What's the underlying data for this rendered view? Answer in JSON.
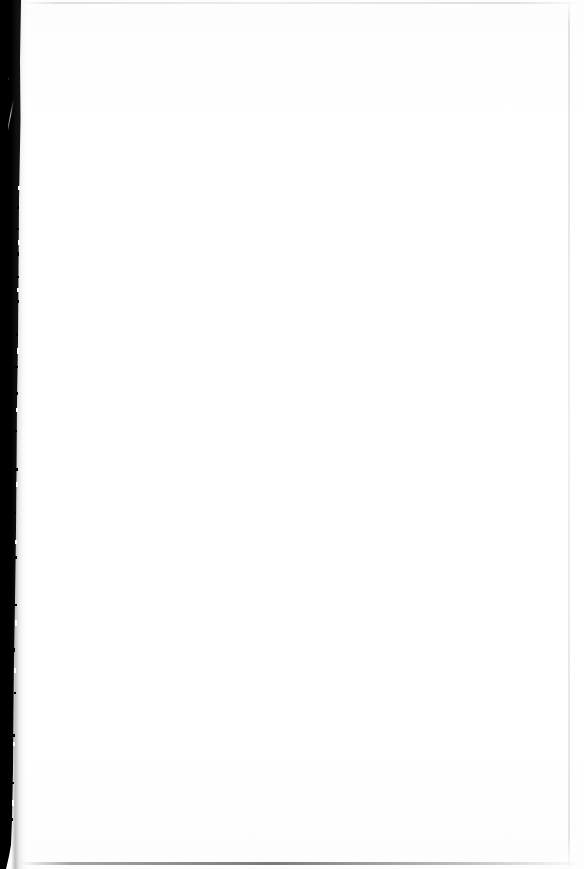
{
  "document": {
    "kind": "scanned-page",
    "page_state": "blank",
    "visible_text": "",
    "width_px": 584,
    "height_px": 869
  },
  "colors": {
    "paper": "#ffffff",
    "gutter": "#000000",
    "edge_hairline": "#9a9ca2",
    "bottom_hairline": "#404248"
  },
  "regions": {
    "paper": {
      "name": "blank-paper-surface",
      "description": ""
    },
    "gutter": {
      "name": "left-scan-gutter",
      "description": "",
      "width_top_px": 21,
      "width_bottom_px": 12
    },
    "sliver": {
      "name": "gutter-light-sliver",
      "description": ""
    },
    "edges": {
      "top": "",
      "right": "",
      "bottom": ""
    }
  },
  "speckles": [
    {
      "x": 17,
      "y": 206,
      "w": 2,
      "h": 3
    },
    {
      "x": 16,
      "y": 228,
      "w": 3,
      "h": 2
    },
    {
      "x": 17,
      "y": 252,
      "w": 2,
      "h": 4
    },
    {
      "x": 16,
      "y": 276,
      "w": 3,
      "h": 2
    },
    {
      "x": 17,
      "y": 300,
      "w": 2,
      "h": 3
    },
    {
      "x": 16,
      "y": 333,
      "w": 2,
      "h": 3
    },
    {
      "x": 15,
      "y": 366,
      "w": 3,
      "h": 2
    },
    {
      "x": 16,
      "y": 392,
      "w": 2,
      "h": 3
    },
    {
      "x": 15,
      "y": 430,
      "w": 2,
      "h": 2
    },
    {
      "x": 15,
      "y": 468,
      "w": 3,
      "h": 3
    },
    {
      "x": 14,
      "y": 512,
      "w": 2,
      "h": 2
    },
    {
      "x": 15,
      "y": 556,
      "w": 2,
      "h": 3
    },
    {
      "x": 14,
      "y": 604,
      "w": 3,
      "h": 2
    },
    {
      "x": 13,
      "y": 648,
      "w": 2,
      "h": 4
    },
    {
      "x": 14,
      "y": 692,
      "w": 2,
      "h": 2
    },
    {
      "x": 13,
      "y": 734,
      "w": 2,
      "h": 3
    },
    {
      "x": 12,
      "y": 782,
      "w": 2,
      "h": 2
    },
    {
      "x": 11,
      "y": 818,
      "w": 2,
      "h": 3
    }
  ],
  "notches": [
    {
      "x": 18,
      "y": 186,
      "w": 2,
      "h": 4
    },
    {
      "x": 18,
      "y": 240,
      "w": 2,
      "h": 5
    },
    {
      "x": 17,
      "y": 288,
      "w": 2,
      "h": 4
    },
    {
      "x": 17,
      "y": 348,
      "w": 2,
      "h": 6
    },
    {
      "x": 16,
      "y": 408,
      "w": 2,
      "h": 4
    },
    {
      "x": 16,
      "y": 482,
      "w": 2,
      "h": 5
    },
    {
      "x": 15,
      "y": 540,
      "w": 2,
      "h": 4
    },
    {
      "x": 15,
      "y": 620,
      "w": 2,
      "h": 6
    },
    {
      "x": 14,
      "y": 668,
      "w": 2,
      "h": 5
    },
    {
      "x": 13,
      "y": 742,
      "w": 2,
      "h": 4
    },
    {
      "x": 12,
      "y": 800,
      "w": 2,
      "h": 6
    }
  ]
}
